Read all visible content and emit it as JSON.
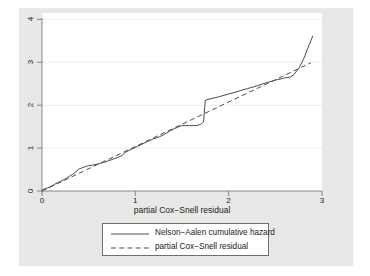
{
  "chart_data": {
    "type": "line",
    "title": "",
    "xlabel": "partial Cox−Snell residual",
    "ylabel": "",
    "xlim": [
      0,
      3
    ],
    "ylim": [
      0,
      4
    ],
    "xticks": [
      "0",
      "1",
      "2",
      "3"
    ],
    "xtick_values": [
      0,
      1,
      2,
      3
    ],
    "yticks": [
      "0",
      "1",
      "2",
      "3",
      "4"
    ],
    "ytick_values": [
      0,
      1,
      2,
      3,
      4
    ],
    "grid": "horizontal",
    "legend_position": "below-axes",
    "background_color": "#e8e8e6",
    "plot_color": "#ffffff",
    "line_color": "#4d4d4d",
    "series": [
      {
        "name": "Nelson−Aalen cumulative hazard",
        "style": "solid",
        "points": [
          [
            0.0,
            0.02
          ],
          [
            0.03,
            0.05
          ],
          [
            0.06,
            0.07
          ],
          [
            0.09,
            0.1
          ],
          [
            0.12,
            0.13
          ],
          [
            0.15,
            0.17
          ],
          [
            0.18,
            0.2
          ],
          [
            0.21,
            0.23
          ],
          [
            0.24,
            0.26
          ],
          [
            0.27,
            0.3
          ],
          [
            0.3,
            0.34
          ],
          [
            0.33,
            0.38
          ],
          [
            0.36,
            0.42
          ],
          [
            0.38,
            0.47
          ],
          [
            0.4,
            0.5
          ],
          [
            0.43,
            0.52
          ],
          [
            0.47,
            0.55
          ],
          [
            0.5,
            0.57
          ],
          [
            0.54,
            0.58
          ],
          [
            0.58,
            0.6
          ],
          [
            0.62,
            0.62
          ],
          [
            0.66,
            0.64
          ],
          [
            0.7,
            0.67
          ],
          [
            0.74,
            0.7
          ],
          [
            0.78,
            0.73
          ],
          [
            0.82,
            0.76
          ],
          [
            0.86,
            0.8
          ],
          [
            0.88,
            0.85
          ],
          [
            0.9,
            0.88
          ],
          [
            0.94,
            0.92
          ],
          [
            0.98,
            0.96
          ],
          [
            1.02,
            1.0
          ],
          [
            1.06,
            1.04
          ],
          [
            1.1,
            1.08
          ],
          [
            1.14,
            1.12
          ],
          [
            1.18,
            1.16
          ],
          [
            1.22,
            1.19
          ],
          [
            1.26,
            1.22
          ],
          [
            1.3,
            1.26
          ],
          [
            1.34,
            1.31
          ],
          [
            1.38,
            1.36
          ],
          [
            1.42,
            1.4
          ],
          [
            1.46,
            1.44
          ],
          [
            1.5,
            1.47
          ],
          [
            1.54,
            1.47
          ],
          [
            1.58,
            1.47
          ],
          [
            1.62,
            1.47
          ],
          [
            1.66,
            1.47
          ],
          [
            1.7,
            1.5
          ],
          [
            1.73,
            1.55
          ],
          [
            1.75,
            2.04
          ],
          [
            1.8,
            2.07
          ],
          [
            1.9,
            2.12
          ],
          [
            2.0,
            2.18
          ],
          [
            2.1,
            2.24
          ],
          [
            2.2,
            2.3
          ],
          [
            2.3,
            2.36
          ],
          [
            2.4,
            2.43
          ],
          [
            2.5,
            2.49
          ],
          [
            2.6,
            2.54
          ],
          [
            2.66,
            2.56
          ],
          [
            2.7,
            2.62
          ],
          [
            2.75,
            2.75
          ],
          [
            2.8,
            2.95
          ],
          [
            2.85,
            3.22
          ],
          [
            2.9,
            3.48
          ]
        ]
      },
      {
        "name": "partial Cox−Snell residual",
        "style": "dashed",
        "points": [
          [
            0.0,
            0.0
          ],
          [
            2.88,
            2.88
          ]
        ]
      }
    ]
  },
  "axis": {
    "x_title": "partial Cox−Snell residual",
    "x_tick_labels": [
      "0",
      "1",
      "2",
      "3"
    ],
    "y_tick_labels": [
      "4",
      "3",
      "2",
      "1",
      "0"
    ]
  },
  "legend": {
    "entries": [
      {
        "label": "Nelson−Aalen cumulative hazard",
        "style": "solid"
      },
      {
        "label": "partial Cox−Snell residual",
        "style": "dashed"
      }
    ]
  }
}
